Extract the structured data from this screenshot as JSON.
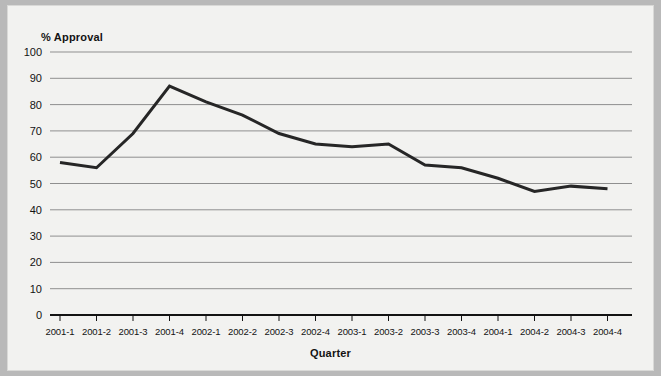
{
  "chart_data": {
    "type": "line",
    "title": "",
    "ylabel": "% Approval",
    "xlabel": "Quarter",
    "ylim": [
      0,
      100
    ],
    "ytick_step": 10,
    "grid": true,
    "legend": "none",
    "line_color": "#262626",
    "background_color": "#f2f2f0",
    "categories": [
      "2001-1",
      "2001-2",
      "2001-3",
      "2001-4",
      "2002-1",
      "2002-2",
      "2002-3",
      "2002-4",
      "2003-1",
      "2003-2",
      "2003-3",
      "2003-4",
      "2004-1",
      "2004-2",
      "2004-3",
      "2004-4"
    ],
    "yticks": [
      0,
      10,
      20,
      30,
      40,
      50,
      60,
      70,
      80,
      90,
      100
    ],
    "series": [
      {
        "name": "% Approval",
        "values": [
          58,
          56,
          69,
          87,
          81,
          76,
          69,
          65,
          64,
          65,
          57,
          56,
          52,
          47,
          49,
          48
        ]
      }
    ]
  }
}
